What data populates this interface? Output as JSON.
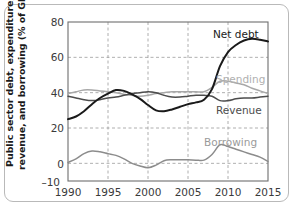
{
  "figure": {
    "border_color": "#b9b9b9",
    "background": "#ffffff"
  },
  "axis": {
    "y_title_line1": "Public sector debt, expenditure,",
    "y_title_line2": "revenue, and borrowing (% of GDP)",
    "y_ticks": [
      "80",
      "60",
      "40",
      "20",
      "0",
      "–10"
    ],
    "x_ticks": [
      "1990",
      "1995",
      "2000",
      "2005",
      "2010",
      "2015"
    ]
  },
  "labels": {
    "net_debt": "Net debt",
    "spending": "Spending",
    "revenue": "Revenue",
    "borrowing": "Borrowing"
  },
  "chart_data": {
    "type": "line",
    "title": "",
    "xlabel": "",
    "ylabel": "Public sector debt, expenditure, revenue, and borrowing (% of GDP)",
    "xlim": [
      1990,
      2015
    ],
    "ylim": [
      -10,
      80
    ],
    "ytick_values": [
      80,
      60,
      40,
      20,
      0,
      -10
    ],
    "xtick_values": [
      1990,
      1995,
      2000,
      2005,
      2010,
      2015
    ],
    "grid": "dashed-both",
    "legend": "inline-annotations",
    "x": [
      1990,
      1991,
      1992,
      1993,
      1994,
      1995,
      1996,
      1997,
      1998,
      1999,
      2000,
      2001,
      2002,
      2003,
      2004,
      2005,
      2006,
      2007,
      2008,
      2009,
      2010,
      2011,
      2012,
      2013,
      2014,
      2015
    ],
    "series": [
      {
        "name": "Net debt",
        "color": "#1a1a1a",
        "width": 2.0,
        "values": [
          25.0,
          26.5,
          29.5,
          33.5,
          37.0,
          39.5,
          41.5,
          41.0,
          39.0,
          36.5,
          33.0,
          30.0,
          29.5,
          30.5,
          32.0,
          33.5,
          34.5,
          36.0,
          42.0,
          55.0,
          63.0,
          67.0,
          69.5,
          70.5,
          70.0,
          69.0
        ]
      },
      {
        "name": "Spending",
        "color": "#a8a8a8",
        "width": 1.5,
        "values": [
          39.5,
          40.5,
          41.5,
          41.5,
          41.0,
          40.5,
          40.0,
          39.0,
          38.5,
          38.0,
          38.5,
          39.5,
          40.0,
          40.5,
          40.5,
          40.5,
          40.5,
          40.5,
          43.0,
          46.5,
          46.5,
          45.5,
          44.5,
          42.5,
          41.0,
          39.5
        ]
      },
      {
        "name": "Revenue",
        "color": "#4d4d4d",
        "width": 1.5,
        "values": [
          38.0,
          37.0,
          36.0,
          35.5,
          36.0,
          37.0,
          37.5,
          38.5,
          39.5,
          40.0,
          40.5,
          40.0,
          38.5,
          37.5,
          37.5,
          38.0,
          38.5,
          38.5,
          38.0,
          35.5,
          35.5,
          36.5,
          37.0,
          37.0,
          37.5,
          38.0
        ]
      },
      {
        "name": "Borrowing",
        "color": "#8c8c8c",
        "width": 1.5,
        "values": [
          0.5,
          2.5,
          5.5,
          7.0,
          6.5,
          5.5,
          4.5,
          2.5,
          0.0,
          -1.5,
          -2.5,
          -1.0,
          1.5,
          2.0,
          2.0,
          2.0,
          1.8,
          1.8,
          5.0,
          10.5,
          9.5,
          8.0,
          6.5,
          5.0,
          3.5,
          1.0
        ]
      }
    ]
  }
}
